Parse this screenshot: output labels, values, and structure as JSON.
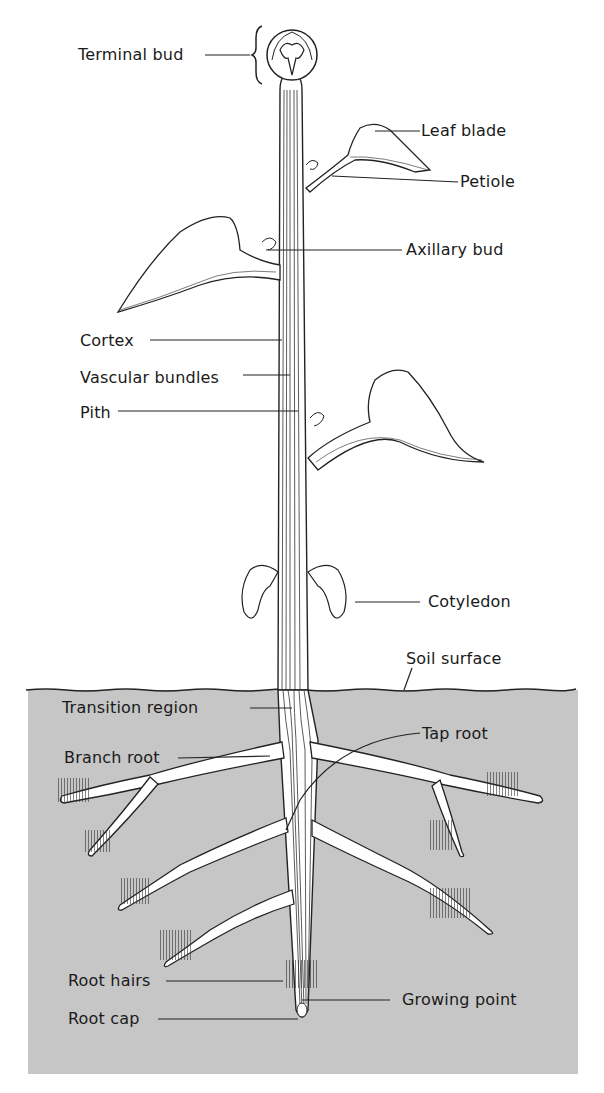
{
  "diagram": {
    "colors": {
      "soil": "#c6c6c6",
      "ink": "#1a1a1a",
      "background": "#ffffff"
    },
    "labels": {
      "terminal_bud": "Terminal bud",
      "leaf_blade": "Leaf blade",
      "petiole": "Petiole",
      "axillary_bud": "Axillary bud",
      "cortex": "Cortex",
      "vascular_bundles": "Vascular bundles",
      "pith": "Pith",
      "cotyledon": "Cotyledon",
      "soil_surface": "Soil surface",
      "transition_region": "Transition region",
      "tap_root": "Tap root",
      "branch_root": "Branch root",
      "root_hairs": "Root hairs",
      "growing_point": "Growing point",
      "root_cap": "Root cap"
    }
  }
}
